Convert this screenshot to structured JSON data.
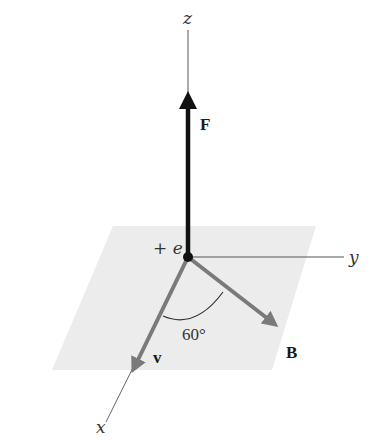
{
  "figure": {
    "axes": {
      "x_label": "x",
      "y_label": "y",
      "z_label": "z"
    },
    "charge_label": "+ e",
    "vectors": {
      "force_label": "F",
      "velocity_label": "v",
      "field_label": "B"
    },
    "angle_label": "60°",
    "colors": {
      "plane_fill": "#ececec",
      "axis_line": "#555555",
      "force_vector": "#111111",
      "velocity_vector": "#7a7a7a",
      "field_vector": "#7a7a7a",
      "charge_dot": "#111111"
    }
  }
}
